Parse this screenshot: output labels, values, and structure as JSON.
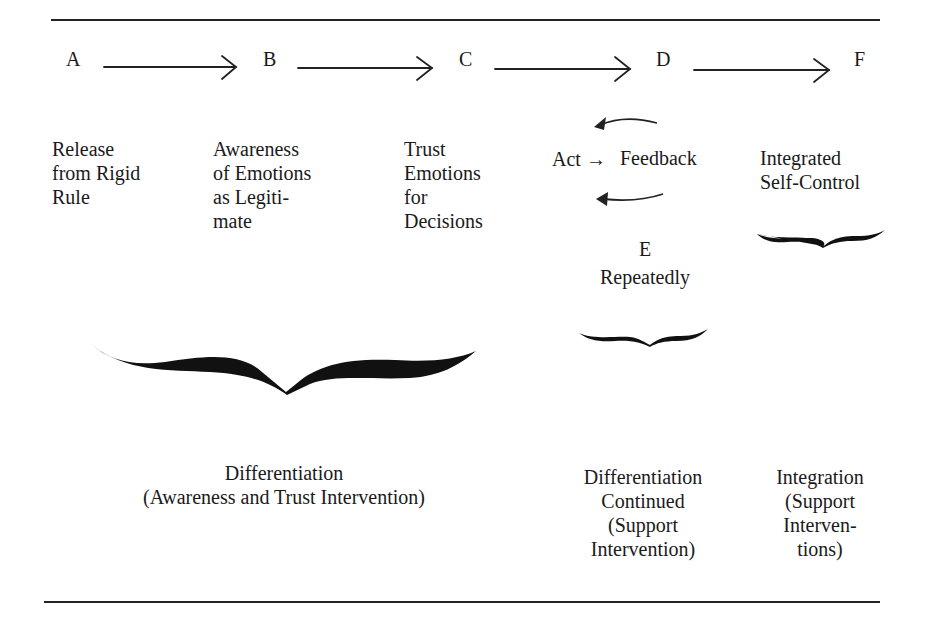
{
  "diagram": {
    "stages": [
      {
        "letter": "A",
        "label": "Release\nfrom Rigid\nRule"
      },
      {
        "letter": "B",
        "label": "Awareness\nof Emotions\nas Legiti-\nmate"
      },
      {
        "letter": "C",
        "label": "Trust\nEmotions\nfor\nDecisions"
      },
      {
        "letter": "D",
        "label": "Act→ Feedback"
      },
      {
        "letter": "F",
        "label": "Integrated\nSelf-Control"
      }
    ],
    "loop": {
      "act": "Act",
      "feedback": "Feedback",
      "letter": "E",
      "note": "Repeatedly"
    },
    "phases": [
      {
        "name": "differentiation",
        "label": "Differentiation\n(Awareness and Trust Intervention)",
        "spans": [
          "A",
          "B",
          "C"
        ]
      },
      {
        "name": "differentiation-continued",
        "label": "Differentiation\nContinued\n(Support\nIntervention)",
        "spans": [
          "D",
          "E"
        ]
      },
      {
        "name": "integration",
        "label": "Integration\n(Support\nInterven-\ntions)",
        "spans": [
          "F"
        ]
      }
    ],
    "icons": {
      "flow_arrow": "right-arrow-icon",
      "loop_arrow": "curved-left-arrow-icon",
      "brace": "horizontal-brace-icon"
    },
    "colors": {
      "ink": "#1a1a1a",
      "background": "#ffffff"
    }
  }
}
